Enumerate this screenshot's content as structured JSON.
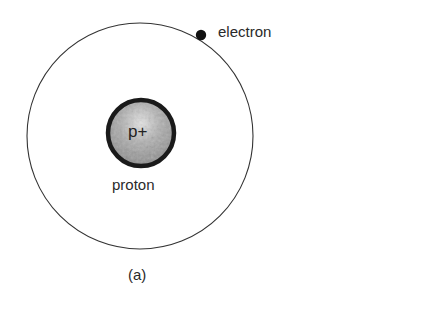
{
  "figure": {
    "caption": "(a)",
    "electron_label": "electron",
    "proton_label": "proton",
    "proton_symbol": "p+",
    "colors": {
      "background": "#ffffff",
      "orbit": "#333333",
      "proton_fill": "#9a9a9a",
      "proton_outline": "#1a1a1a",
      "electron": "#111111"
    },
    "geometry": {
      "orbit": {
        "cx": 140,
        "cy": 136,
        "r": 113
      },
      "proton": {
        "cx": 141,
        "cy": 133,
        "r": 33
      },
      "electron": {
        "cx": 201,
        "cy": 35,
        "r": 5
      }
    }
  }
}
